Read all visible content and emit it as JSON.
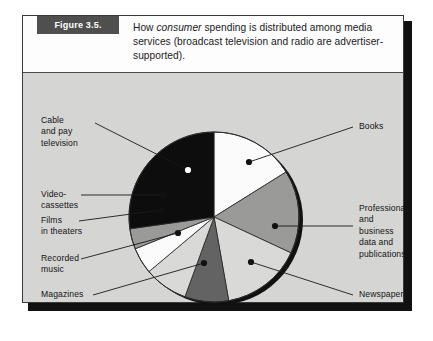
{
  "figure": {
    "label": "Figure 3.5.",
    "caption_part1": "How ",
    "caption_emphasis": "consumer",
    "caption_part2": " spending is distributed among media services (broadcast television and radio are advertiser-supported)."
  },
  "colors": {
    "page_background": "#ffffff",
    "frame_background": "#d5d5d3",
    "caption_background": "#fdfdfd",
    "label_box": "#4f4f4f",
    "frame_border": "#3a3a3a",
    "shadow": "#111111",
    "slice_black": "#0d0d0d",
    "slice_white": "#fbfbfb",
    "slice_light_gray": "#d9d9d7",
    "slice_medium_gray": "#9a9a98",
    "slice_dark_gray": "#636363",
    "leader_line": "#1a1a1a"
  },
  "chart_data": {
    "type": "pie",
    "title": "How consumer spending is distributed among media services",
    "legend_position": "callout-labels",
    "grid": false,
    "categories": [
      "Books",
      "Professional and business data and publications",
      "Newspapers",
      "Magazines",
      "Recorded music",
      "Films in theaters",
      "Video-cassettes",
      "Cable and pay television"
    ],
    "values": [
      16.1,
      15.8,
      15.3,
      8.3,
      8.3,
      5.0,
      3.9,
      27.3
    ],
    "slices": [
      {
        "label": "Books",
        "start_deg": 0,
        "end_deg": 58,
        "value": 16.1,
        "fill": "#fbfbfb"
      },
      {
        "label": "Professional and business data and publications",
        "start_deg": 58,
        "end_deg": 115,
        "value": 15.8,
        "fill": "#9a9a98"
      },
      {
        "label": "Newspapers",
        "start_deg": 115,
        "end_deg": 170,
        "value": 15.3,
        "fill": "#d9d9d7"
      },
      {
        "label": "Magazines",
        "start_deg": 170,
        "end_deg": 200,
        "value": 8.3,
        "fill": "#636363"
      },
      {
        "label": "Recorded music",
        "start_deg": 200,
        "end_deg": 230,
        "value": 8.3,
        "fill": "#d9d9d7"
      },
      {
        "label": "Films in theaters",
        "start_deg": 230,
        "end_deg": 248,
        "value": 5.0,
        "fill": "#fbfbfb"
      },
      {
        "label": "Video-cassettes",
        "start_deg": 248,
        "end_deg": 262,
        "value": 3.9,
        "fill": "#9a9a98"
      },
      {
        "label": "Cable and pay television",
        "start_deg": 262,
        "end_deg": 360,
        "value": 27.3,
        "fill": "#0d0d0d"
      }
    ]
  },
  "labels": {
    "cable": "Cable\nand pay\ntelevision",
    "video": "Video-\ncassettes",
    "films": "Films\nin theaters",
    "recorded": "Recorded\nmusic",
    "magazines": "Magazines",
    "books": "Books",
    "professional": "Professional\nand business\ndata and\npublications",
    "newspapers": "Newspapers"
  }
}
